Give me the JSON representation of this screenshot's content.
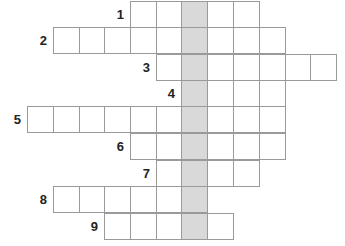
{
  "puzzle": {
    "type": "crossword",
    "cell_size": 26,
    "origin_x": 1,
    "origin_y": 1,
    "col_x": [
      27,
      53,
      79,
      104,
      130,
      156,
      181,
      207,
      233,
      259,
      285,
      310
    ],
    "row_y": [
      1,
      27,
      54,
      80,
      106,
      133,
      160,
      186,
      213
    ],
    "shaded_column": 6,
    "colors": {
      "cell_fill": "#ffffff",
      "shaded_fill": "#d9d9d9",
      "border": "#9a9a9a",
      "number": "#222222"
    },
    "rows": [
      {
        "number": "1",
        "start_col": 4,
        "length": 5
      },
      {
        "number": "2",
        "start_col": 1,
        "length": 9
      },
      {
        "number": "3",
        "start_col": 5,
        "length": 7
      },
      {
        "number": "4",
        "start_col": 6,
        "length": 4
      },
      {
        "number": "5",
        "start_col": 0,
        "length": 10
      },
      {
        "number": "6",
        "start_col": 4,
        "length": 6
      },
      {
        "number": "7",
        "start_col": 5,
        "length": 4
      },
      {
        "number": "8",
        "start_col": 1,
        "length": 6
      },
      {
        "number": "9",
        "start_col": 3,
        "length": 5
      }
    ]
  }
}
